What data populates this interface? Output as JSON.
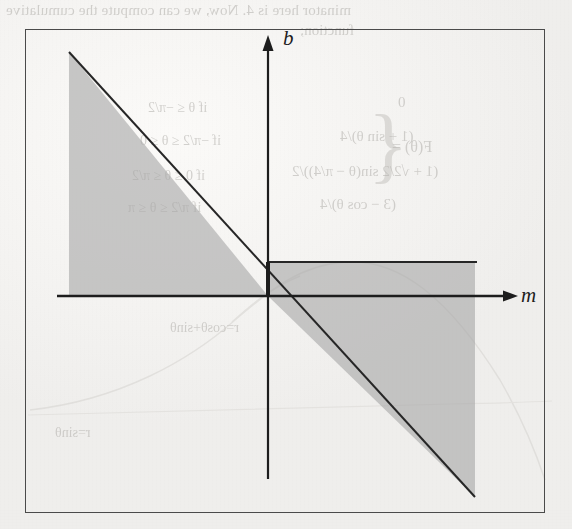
{
  "page": {
    "kind": "scanned-textbook-figure",
    "background_color": "#f3f2f0",
    "ink_color": "#1d1d1d"
  },
  "bleed_through": {
    "note": "mirrored show-through text from the reverse side of the scanned page",
    "color": "#b9b7b3",
    "top_line": "minator here is 4. Now, we can compute the cumulative",
    "top_line2": "function;",
    "equation_lhs": "F(θ) =",
    "brace": "{",
    "equation_rows": [
      "0",
      "(1 + sin θ)/4",
      "(1 + √2/2 sin(θ − π/4))/2",
      "(3 − cos θ)/4"
    ],
    "conditions": [
      "if θ ≤ −π/2",
      "if −π/2 ≤ θ ≤ 0",
      "if 0 ≤ θ ≤ π/2",
      "if π/2 ≤ θ ≤ π"
    ],
    "curve_labels": [
      "r=cosθ+sinθ",
      "r=sinθ"
    ]
  },
  "figure": {
    "name": "dual-parameter-space-plot",
    "frame": {
      "x": 25,
      "y": 29,
      "width": 520,
      "height": 484,
      "stroke": "#4a4a4a"
    },
    "axes": {
      "horizontal": {
        "label": "m",
        "label_style": "italic",
        "arrow": true
      },
      "vertical": {
        "label": "b",
        "label_style": "italic",
        "arrow": true
      },
      "origin_px": {
        "x": 268,
        "y": 296
      },
      "stroke": "#1d1d1d"
    },
    "shading": {
      "fill": "#a8a8a8",
      "opacity": 0.62,
      "regions": [
        {
          "name": "upper-left-triangle",
          "description": "triangle above the m-axis bounded left by a vertical edge, below by the m-axis and on the hypotenuse by the descending diagonal line"
        },
        {
          "name": "upper-right-band",
          "description": "horizontal band between the b = constant line and the m-axis, right of the b-axis"
        },
        {
          "name": "lower-right-triangle",
          "description": "triangle below the m-axis bounded above by the m-axis, on the left by the descending diagonal line and right by a vertical edge"
        }
      ]
    },
    "lines": [
      {
        "name": "diagonal-constraint-line",
        "description": "descending line of negative slope through the origin"
      },
      {
        "name": "horizontal-constraint-line",
        "description": "horizontal line at positive b, right of the b-axis"
      }
    ]
  }
}
